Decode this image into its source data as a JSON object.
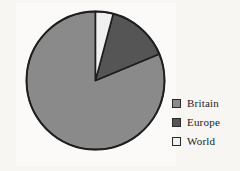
{
  "chart_data": {
    "type": "pie",
    "title": "",
    "subtitle": "",
    "xlabel": "",
    "ylabel": "",
    "grid": false,
    "legend_position": "right",
    "start_angle_deg": 0,
    "direction": "counterclockwise",
    "categories": [
      "Britain",
      "Europe",
      "World"
    ],
    "values": [
      81.3,
      14.6,
      4.1
    ],
    "units": "percent",
    "slice_angles_deg": [
      292.5,
      52.6,
      14.9
    ],
    "colors": [
      "#8a8a8a",
      "#555555",
      "#f0f0f0"
    ],
    "slice_border_color": "#1e1e1e",
    "slices": [
      {
        "label": "Britain",
        "value": 81.3,
        "angle_deg": 292.5,
        "color": "#8a8a8a"
      },
      {
        "label": "Europe",
        "value": 14.6,
        "angle_deg": 52.6,
        "color": "#555555"
      },
      {
        "label": "World",
        "value": 4.1,
        "angle_deg": 14.9,
        "color": "#f0f0f0"
      }
    ]
  },
  "legend": {
    "items": [
      {
        "label": "Britain",
        "color": "#8a8a8a",
        "swatch_icon": "square-swatch-icon"
      },
      {
        "label": "Europe",
        "color": "#555555",
        "swatch_icon": "square-swatch-icon"
      },
      {
        "label": "World",
        "color": "#f0f0f0",
        "swatch_icon": "square-swatch-icon"
      }
    ]
  },
  "style": {
    "page_background": "#f7f6f3",
    "plot_background": "#fbfaf8",
    "outline_color": "#1e1e1e",
    "text_color": "#1c1c1c"
  },
  "geometry": {
    "center_x": 95.5,
    "center_y": 80.5,
    "radius": 69
  }
}
